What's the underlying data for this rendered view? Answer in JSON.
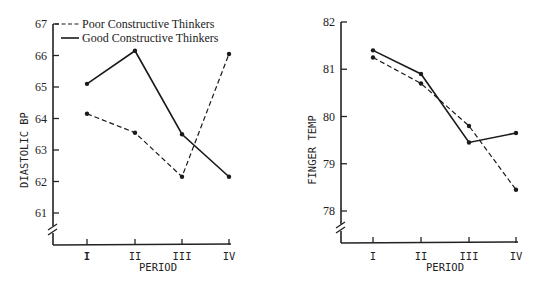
{
  "chart_data": [
    {
      "type": "line",
      "title": "",
      "xlabel": "PERIOD",
      "ylabel": "DIASTOLIC BP",
      "categories": [
        "I",
        "II",
        "III",
        "IV"
      ],
      "yticks": [
        61,
        62,
        63,
        64,
        65,
        66,
        67
      ],
      "ylim": [
        60.0,
        67
      ],
      "axis_break": true,
      "legend": {
        "position": "top-left-inside",
        "entries": [
          "Poor Constructive Thinkers",
          "Good Constructive Thinkers"
        ]
      },
      "series": [
        {
          "name": "Poor Constructive Thinkers",
          "style": "dashed",
          "values": [
            64.15,
            63.55,
            62.15,
            66.05
          ]
        },
        {
          "name": "Good Constructive Thinkers",
          "style": "solid",
          "values": [
            65.1,
            66.15,
            63.5,
            62.15
          ]
        }
      ]
    },
    {
      "type": "line",
      "title": "",
      "xlabel": "PERIOD",
      "ylabel": "FINGER TEMP",
      "categories": [
        "I",
        "II",
        "III",
        "IV"
      ],
      "yticks": [
        78,
        79,
        80,
        81,
        82
      ],
      "ylim": [
        77.3,
        82
      ],
      "axis_break": true,
      "series": [
        {
          "name": "Poor Constructive Thinkers",
          "style": "dashed",
          "values": [
            81.25,
            80.7,
            79.8,
            78.45
          ]
        },
        {
          "name": "Good Constructive Thinkers",
          "style": "solid",
          "values": [
            81.4,
            80.9,
            79.45,
            79.65
          ]
        }
      ]
    }
  ]
}
